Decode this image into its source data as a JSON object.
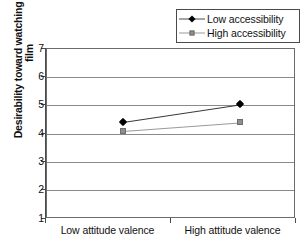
{
  "chart_data": {
    "type": "line",
    "title": "",
    "xlabel": "",
    "ylabel": "Desirability toward watching thriller film",
    "categories": [
      "Low attitude valence",
      "High attitude valence"
    ],
    "ylim": [
      1,
      7
    ],
    "yticks": [
      7,
      6,
      5,
      4,
      3,
      2,
      1
    ],
    "ytick_labels": [
      "7",
      "6",
      "5",
      "4",
      "3",
      "2",
      "1"
    ],
    "grid": true,
    "legend_position": "top-right",
    "series": [
      {
        "name": "Low accessibility",
        "marker": "diamond",
        "color": "#000000",
        "values": [
          4.43,
          5.05
        ]
      },
      {
        "name": "High accessibility",
        "marker": "square",
        "color": "#8e8e8e",
        "values": [
          4.12,
          4.42
        ]
      }
    ]
  },
  "legend": {
    "items": [
      {
        "label": "Low accessibility",
        "marker": "diamond"
      },
      {
        "label": "High accessibility",
        "marker": "square"
      }
    ]
  },
  "axes": {
    "y_title": "Desirability toward watching thriller film",
    "y_ticks": [
      "7",
      "6",
      "5",
      "4",
      "3",
      "2",
      "1"
    ],
    "x_ticks": [
      "Low attitude valence",
      "High attitude valence"
    ]
  },
  "colors": {
    "low_accessibility": "#000000",
    "high_accessibility": "#8e8e8e",
    "grid": "#8a8a8a",
    "frame": "#6b6b6b",
    "background": "#ffffff"
  }
}
